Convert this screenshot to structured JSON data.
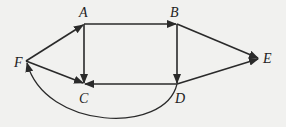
{
  "diagram": {
    "type": "directed-graph",
    "colors": {
      "background": "#f1f1ef",
      "edge": "#2a2a2a",
      "label": "#222222"
    },
    "nodes": [
      {
        "id": "A",
        "label": "A",
        "x": 84,
        "y": 24
      },
      {
        "id": "B",
        "label": "B",
        "x": 177,
        "y": 24
      },
      {
        "id": "C",
        "label": "C",
        "x": 84,
        "y": 84
      },
      {
        "id": "D",
        "label": "D",
        "x": 177,
        "y": 84
      },
      {
        "id": "E",
        "label": "E",
        "x": 259,
        "y": 58
      },
      {
        "id": "F",
        "label": "F",
        "x": 26,
        "y": 61
      }
    ],
    "edges": [
      {
        "from": "F",
        "to": "A"
      },
      {
        "from": "F",
        "to": "C"
      },
      {
        "from": "A",
        "to": "B"
      },
      {
        "from": "A",
        "to": "C"
      },
      {
        "from": "B",
        "to": "D"
      },
      {
        "from": "B",
        "to": "E"
      },
      {
        "from": "D",
        "to": "E"
      },
      {
        "from": "D",
        "to": "C"
      },
      {
        "from": "D",
        "to": "F",
        "curved": true
      }
    ]
  }
}
